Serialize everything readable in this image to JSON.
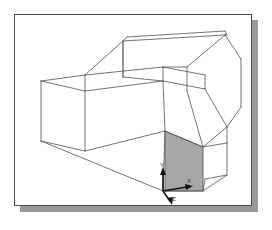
{
  "app": {
    "title": "3D Wireframe Model Viewport",
    "view_label": "Isometric"
  },
  "viewport": {
    "background_color": "#ffffff",
    "border_color": "#4a4a4a",
    "shadow_color": "#9a9a9a",
    "wireframe_color": "#5a5a5a",
    "shaded_face_color": "#a8a8a8",
    "axis_color": "#111111"
  },
  "model": {
    "name": "extruded-solid-wireframe",
    "description": "Isometric wireframe of a multi-step extruded solid with one highlighted planar face",
    "highlighted_face": {
      "name": "selected-face",
      "fill": "#a8a8a8",
      "points": "150,116 188,132 188,176 150,176"
    },
    "edges": [
      "70,76 26,66",
      "26,66 26,126",
      "26,126 70,136",
      "70,136 70,76",
      "70,76 148,66",
      "148,66 190,74",
      "26,66 70,60",
      "70,60 148,52",
      "148,52 190,60",
      "190,60 190,74",
      "148,52 148,66",
      "108,26 112,22",
      "112,22 210,16",
      "210,16 212,20",
      "108,26 210,20",
      "210,20 212,20",
      "108,26 70,60",
      "108,26 108,62",
      "210,20 172,52",
      "172,52 148,52",
      "172,52 172,76",
      "210,20 226,44",
      "226,44 226,92",
      "226,92 212,112",
      "212,112 212,128",
      "190,74 212,112",
      "26,126 148,176",
      "148,176 188,176",
      "188,176 212,160",
      "212,160 212,128",
      "212,128 188,132",
      "188,132 150,116",
      "150,116 148,176",
      "70,136 150,116",
      "148,66 150,116",
      "172,76 188,132",
      "108,62 148,66",
      "212,112 188,132",
      "212,160 190,164",
      "190,164 188,176"
    ]
  },
  "axis_indicator": {
    "name": "axis-triad",
    "origin": {
      "x": 148,
      "y": 176
    },
    "axes": [
      {
        "label": "Y",
        "direction": "up",
        "label_x": 150,
        "label_y": 150
      },
      {
        "label": "X",
        "direction": "right",
        "label_x": 176,
        "label_y": 167
      },
      {
        "label": "Z",
        "direction": "down-left",
        "label_x": 157,
        "label_y": 192
      }
    ]
  }
}
